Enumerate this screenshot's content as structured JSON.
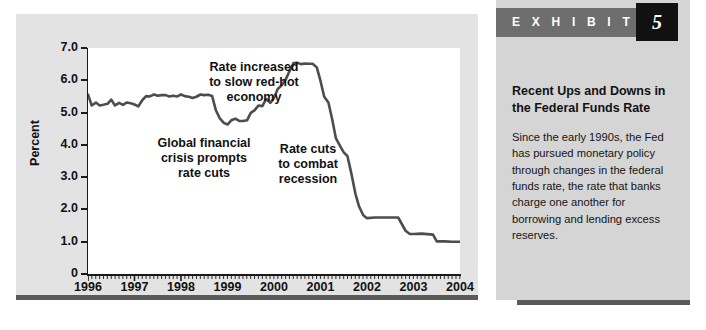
{
  "exhibit": {
    "header_label": "E X H I B I T",
    "number": "5",
    "title": "Recent Ups and Downs in\nthe Federal Funds Rate",
    "body": "Since the early 1990s, the Fed has pursued monetary policy through changes in the federal funds rate, the rate that banks charge one another for borrowing and lending excess reserves."
  },
  "annotations": {
    "rate_increased": "Rate increased\nto slow red-hot\neconomy",
    "global_crisis": "Global financial\ncrisis prompts\nrate cuts",
    "rate_cuts": "Rate cuts\nto combat\nrecession"
  },
  "chart_data": {
    "type": "line",
    "title": "",
    "xlabel": "",
    "ylabel": "Percent",
    "xlim": [
      1996,
      2004
    ],
    "ylim": [
      0,
      7
    ],
    "grid": false,
    "legend": "none",
    "y_ticks": [
      "0",
      "1.0",
      "2.0",
      "3.0",
      "4.0",
      "5.0",
      "6.0",
      "7.0"
    ],
    "y_tick_values": [
      0,
      1,
      2,
      3,
      4,
      5,
      6,
      7
    ],
    "x_ticks": [
      "1996",
      "1997",
      "1998",
      "1999",
      "2000",
      "2001",
      "2002",
      "2003",
      "2004"
    ],
    "x_tick_values": [
      1996,
      1997,
      1998,
      1999,
      2000,
      2001,
      2002,
      2003,
      2004
    ],
    "x_minor_tick_interval": 0.0833,
    "series": [
      {
        "name": "Federal funds rate",
        "color": "#4d4d4d",
        "x": [
          1996.0,
          1996.08,
          1996.17,
          1996.25,
          1996.33,
          1996.42,
          1996.5,
          1996.58,
          1996.67,
          1996.75,
          1996.83,
          1996.92,
          1997.0,
          1997.08,
          1997.17,
          1997.25,
          1997.33,
          1997.42,
          1997.5,
          1997.58,
          1997.67,
          1997.75,
          1997.83,
          1997.92,
          1998.0,
          1998.08,
          1998.17,
          1998.25,
          1998.33,
          1998.42,
          1998.5,
          1998.58,
          1998.67,
          1998.75,
          1998.83,
          1998.92,
          1999.0,
          1999.08,
          1999.17,
          1999.25,
          1999.33,
          1999.42,
          1999.5,
          1999.58,
          1999.67,
          1999.75,
          1999.83,
          1999.92,
          2000.0,
          2000.08,
          2000.17,
          2000.25,
          2000.33,
          2000.42,
          2000.5,
          2000.58,
          2000.67,
          2000.75,
          2000.83,
          2000.92,
          2001.0,
          2001.08,
          2001.17,
          2001.25,
          2001.33,
          2001.42,
          2001.5,
          2001.58,
          2001.67,
          2001.75,
          2001.83,
          2001.92,
          2002.0,
          2002.17,
          2002.42,
          2002.67,
          2002.83,
          2002.92,
          2003.0,
          2003.17,
          2003.42,
          2003.5,
          2003.67,
          2003.83,
          2004.0
        ],
        "y": [
          5.56,
          5.22,
          5.31,
          5.22,
          5.24,
          5.27,
          5.4,
          5.22,
          5.3,
          5.24,
          5.31,
          5.29,
          5.25,
          5.19,
          5.39,
          5.51,
          5.5,
          5.56,
          5.52,
          5.54,
          5.54,
          5.5,
          5.52,
          5.5,
          5.56,
          5.51,
          5.49,
          5.45,
          5.49,
          5.56,
          5.54,
          5.55,
          5.51,
          5.07,
          4.83,
          4.68,
          4.63,
          4.76,
          4.81,
          4.74,
          4.74,
          4.76,
          4.99,
          5.07,
          5.22,
          5.2,
          5.42,
          5.3,
          5.45,
          5.73,
          5.85,
          6.02,
          6.27,
          6.53,
          6.54,
          6.5,
          6.52,
          6.51,
          6.51,
          6.4,
          5.98,
          5.49,
          5.31,
          4.8,
          4.21,
          3.97,
          3.77,
          3.65,
          3.07,
          2.49,
          2.09,
          1.82,
          1.73,
          1.75,
          1.75,
          1.75,
          1.34,
          1.24,
          1.24,
          1.25,
          1.22,
          1.01,
          1.01,
          1.0,
          1.0
        ]
      }
    ],
    "annotations": [
      {
        "text": "Rate increased to slow red-hot economy",
        "at_x": 2000.1,
        "at_y": 6.5
      },
      {
        "text": "Global financial crisis prompts rate cuts",
        "at_x": 1998.8,
        "at_y": 4.7
      },
      {
        "text": "Rate cuts to combat recession",
        "at_x": 2001.3,
        "at_y": 4.0
      }
    ]
  }
}
